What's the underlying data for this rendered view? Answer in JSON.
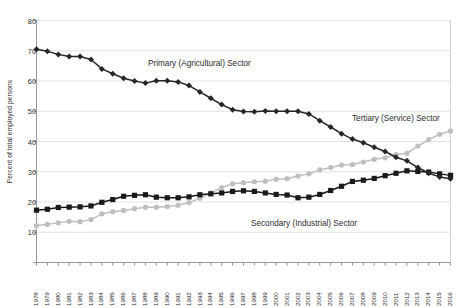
{
  "chart_data": {
    "type": "line",
    "title": "",
    "xlabel": "",
    "ylabel": "Percent of total employed persons",
    "ylim": [
      0,
      80
    ],
    "ytick_step": 10,
    "yticks": [
      0,
      10,
      20,
      30,
      40,
      50,
      60,
      70,
      80
    ],
    "grid": true,
    "legend_position": "inline-annotations",
    "x": [
      1978,
      1979,
      1980,
      1981,
      1982,
      1983,
      1984,
      1985,
      1986,
      1987,
      1988,
      1989,
      1990,
      1991,
      1992,
      1993,
      1994,
      1995,
      1996,
      1997,
      1998,
      1999,
      2000,
      2001,
      2002,
      2003,
      2004,
      2005,
      2006,
      2007,
      2008,
      2009,
      2010,
      2011,
      2012,
      2013,
      2014,
      2015,
      2016
    ],
    "categories": [
      "1978",
      "1979",
      "1980",
      "1981",
      "1982",
      "1983",
      "1984",
      "1985",
      "1986",
      "1987",
      "1988",
      "1989",
      "1990",
      "1991",
      "1992",
      "1993",
      "1994",
      "1995",
      "1996",
      "1997",
      "1998",
      "1999",
      "2000",
      "2001",
      "2002",
      "2003",
      "2004",
      "2005",
      "2006",
      "2007",
      "2008",
      "2009",
      "2010",
      "2011",
      "2012",
      "2013",
      "2014",
      "2015",
      "2016"
    ],
    "series": [
      {
        "name": "Primary (Agricultural) Sector",
        "color": "#262626",
        "marker": "diamond",
        "values": [
          70.5,
          69.8,
          68.8,
          68.1,
          68.1,
          67.1,
          64.0,
          62.4,
          60.9,
          60.0,
          59.3,
          60.1,
          60.1,
          59.7,
          58.5,
          56.4,
          54.3,
          52.2,
          50.5,
          49.9,
          49.8,
          50.1,
          50.0,
          50.0,
          50.0,
          49.1,
          46.9,
          44.8,
          42.6,
          40.8,
          39.6,
          38.1,
          36.7,
          34.8,
          33.6,
          31.4,
          29.5,
          28.3,
          27.7
        ]
      },
      {
        "name": "Secondary (Industrial) Sector",
        "color": "#1a1a1a",
        "marker": "square",
        "values": [
          17.3,
          17.6,
          18.2,
          18.3,
          18.4,
          18.7,
          19.9,
          20.8,
          21.9,
          22.2,
          22.4,
          21.6,
          21.4,
          21.4,
          21.7,
          22.4,
          22.7,
          23.0,
          23.5,
          23.7,
          23.5,
          23.0,
          22.5,
          22.3,
          21.4,
          21.6,
          22.5,
          23.8,
          25.2,
          26.8,
          27.2,
          27.8,
          28.7,
          29.5,
          30.3,
          30.1,
          29.9,
          29.3,
          28.8
        ]
      },
      {
        "name": "Tertiary (Service) Sector",
        "color": "#bfbfbf",
        "marker": "circle",
        "values": [
          12.2,
          12.6,
          13.1,
          13.6,
          13.5,
          14.2,
          16.1,
          16.8,
          17.2,
          17.8,
          18.3,
          18.3,
          18.5,
          18.9,
          19.8,
          21.2,
          23.0,
          24.8,
          26.0,
          26.4,
          26.7,
          26.9,
          27.5,
          27.7,
          28.6,
          29.3,
          30.6,
          31.4,
          32.2,
          32.4,
          33.2,
          34.1,
          34.6,
          35.7,
          36.1,
          38.5,
          40.6,
          42.4,
          43.5
        ]
      }
    ],
    "annotations": [
      {
        "text": "Primary (Agricultural) Sector",
        "x_px": 148,
        "y_px": 59
      },
      {
        "text": "Tertiary (Service) Sector",
        "x_px": 352,
        "y_px": 114
      },
      {
        "text": "Secondary (Industrial) Sector",
        "x_px": 251,
        "y_px": 219
      }
    ]
  }
}
